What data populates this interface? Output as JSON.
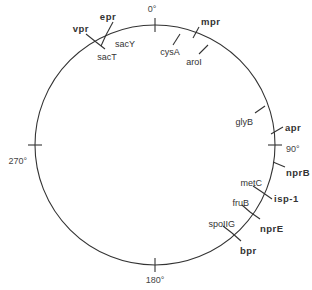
{
  "diagram": {
    "type": "circular genetic map",
    "center": [
      155,
      145
    ],
    "radius": 120,
    "colors": {
      "line": "#333333",
      "text": "#333333",
      "background": "#ffffff"
    },
    "degree_marks": [
      {
        "label": "0°",
        "angle": 0,
        "lx": 152,
        "ly": 12,
        "anchor": "middle"
      },
      {
        "label": "90°",
        "angle": 90,
        "lx": 286,
        "ly": 152,
        "anchor": "start"
      },
      {
        "label": "180°",
        "angle": 180,
        "lx": 155,
        "ly": 283,
        "anchor": "middle"
      },
      {
        "label": "270°",
        "angle": 270,
        "lx": 27,
        "ly": 164,
        "anchor": "end"
      }
    ],
    "genes_outer": [
      {
        "label": "epr",
        "x1": 106,
        "y1": 35,
        "x2": 113,
        "y2": 22,
        "lx": 108,
        "ly": 20,
        "anchor": "middle",
        "bold": true
      },
      {
        "label": "vpr",
        "x1": 96,
        "y1": 42,
        "x2": 86,
        "y2": 34,
        "lx": 89,
        "ly": 32,
        "anchor": "end",
        "bold": true
      },
      {
        "label": "mpr",
        "x1": 193,
        "y1": 38,
        "x2": 199,
        "y2": 27,
        "lx": 201,
        "ly": 25,
        "anchor": "start",
        "bold": true
      },
      {
        "label": "apr",
        "x1": 271,
        "y1": 134,
        "x2": 283,
        "y2": 127,
        "lx": 285,
        "ly": 131,
        "anchor": "start",
        "bold": true
      },
      {
        "label": "nprB",
        "x1": 273,
        "y1": 162,
        "x2": 285,
        "y2": 167,
        "lx": 286,
        "ly": 176,
        "anchor": "start",
        "bold": true
      },
      {
        "label": "isp-1",
        "x1": 262,
        "y1": 192,
        "x2": 272,
        "y2": 199,
        "lx": 274,
        "ly": 202,
        "anchor": "start",
        "bold": true
      },
      {
        "label": "nprE",
        "x1": 250,
        "y1": 212,
        "x2": 260,
        "y2": 219,
        "lx": 260,
        "ly": 232,
        "anchor": "start",
        "bold": true
      },
      {
        "label": "bpr",
        "x1": 232,
        "y1": 233,
        "x2": 241,
        "y2": 241,
        "lx": 240,
        "ly": 254,
        "anchor": "start",
        "bold": true
      }
    ],
    "genes_inner": [
      {
        "label": "sacY",
        "x1": 106,
        "y1": 35,
        "x2": 101,
        "y2": 46,
        "lx": 115,
        "ly": 47,
        "anchor": "start"
      },
      {
        "label": "sacT",
        "x1": 96,
        "y1": 42,
        "x2": 105,
        "y2": 49,
        "lx": 107,
        "ly": 60,
        "anchor": "middle"
      },
      {
        "label": "cysA",
        "x1": 180,
        "y1": 34,
        "x2": 173,
        "y2": 45,
        "lx": 170,
        "ly": 55,
        "anchor": "middle"
      },
      {
        "label": "aroI",
        "x1": 208,
        "y1": 45,
        "x2": 199,
        "y2": 54,
        "lx": 194,
        "ly": 65,
        "anchor": "middle"
      },
      {
        "label": "glyB",
        "x1": 265,
        "y1": 106,
        "x2": 255,
        "y2": 113,
        "lx": 253,
        "ly": 125,
        "anchor": "end"
      },
      {
        "label": "metC",
        "x1": 262,
        "y1": 192,
        "x2": 253,
        "y2": 186,
        "lx": 262,
        "ly": 186,
        "anchor": "end"
      },
      {
        "label": "fruB",
        "x1": 250,
        "y1": 212,
        "x2": 242,
        "y2": 205,
        "lx": 249,
        "ly": 206,
        "anchor": "end"
      },
      {
        "label": "spoIIG",
        "x1": 232,
        "y1": 233,
        "x2": 223,
        "y2": 226,
        "lx": 235,
        "ly": 227,
        "anchor": "end"
      }
    ]
  }
}
